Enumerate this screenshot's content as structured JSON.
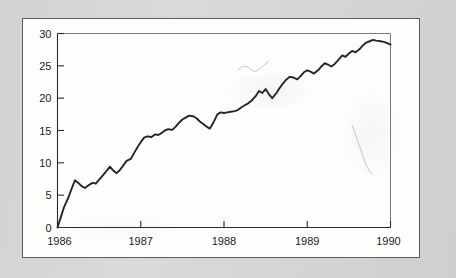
{
  "figure": {
    "panel_background": "#fdfdfc",
    "page_background": "#d6d6d4",
    "frame_color": "#5b5b5b"
  },
  "chart_data": {
    "type": "line",
    "title": "",
    "subtitle": "",
    "xlabel": "",
    "ylabel": "",
    "xlim": [
      1986,
      1990
    ],
    "ylim": [
      0,
      30
    ],
    "grid": false,
    "legend": null,
    "line_color": "#262626",
    "x_tick_labels": [
      "1986",
      "1987",
      "1988",
      "1989",
      "1990"
    ],
    "x_ticks": [
      1986,
      1987,
      1988,
      1989,
      1990
    ],
    "y_tick_labels": [
      "0",
      "5",
      "10",
      "15",
      "20",
      "25",
      "30"
    ],
    "y_ticks": [
      0,
      5,
      10,
      15,
      20,
      25,
      30
    ],
    "series": [
      {
        "name": "series-1",
        "x": [
          1986.0,
          1986.04,
          1986.08,
          1986.13,
          1986.17,
          1986.21,
          1986.25,
          1986.29,
          1986.33,
          1986.38,
          1986.42,
          1986.46,
          1986.5,
          1986.54,
          1986.58,
          1986.63,
          1986.67,
          1986.71,
          1986.75,
          1986.79,
          1986.83,
          1986.88,
          1986.92,
          1986.96,
          1987.0,
          1987.04,
          1987.08,
          1987.13,
          1987.17,
          1987.21,
          1987.25,
          1987.29,
          1987.33,
          1987.38,
          1987.42,
          1987.46,
          1987.5,
          1987.54,
          1987.58,
          1987.63,
          1987.67,
          1987.71,
          1987.75,
          1987.79,
          1987.83,
          1987.88,
          1987.92,
          1987.96,
          1988.0,
          1988.04,
          1988.08,
          1988.13,
          1988.17,
          1988.21,
          1988.25,
          1988.29,
          1988.33,
          1988.38,
          1988.42,
          1988.46,
          1988.5,
          1988.54,
          1988.58,
          1988.63,
          1988.67,
          1988.71,
          1988.75,
          1988.79,
          1988.83,
          1988.88,
          1988.92,
          1988.96,
          1989.0,
          1989.04,
          1989.08,
          1989.13,
          1989.17,
          1989.21,
          1989.25,
          1989.29,
          1989.33,
          1989.38,
          1989.42,
          1989.46,
          1989.5,
          1989.54,
          1989.58,
          1989.63,
          1989.67,
          1989.71,
          1989.75,
          1989.79,
          1989.83,
          1989.88,
          1989.92,
          1989.96,
          1990.0
        ],
        "values": [
          0.0,
          1.6,
          3.2,
          4.6,
          6.0,
          7.3,
          6.9,
          6.4,
          6.1,
          6.6,
          6.9,
          6.8,
          7.4,
          8.0,
          8.6,
          9.4,
          8.8,
          8.4,
          8.9,
          9.6,
          10.3,
          10.6,
          11.5,
          12.4,
          13.2,
          13.9,
          14.1,
          14.0,
          14.4,
          14.3,
          14.6,
          15.0,
          15.2,
          15.1,
          15.6,
          16.2,
          16.7,
          17.0,
          17.3,
          17.2,
          16.9,
          16.4,
          16.0,
          15.6,
          15.3,
          16.4,
          17.5,
          17.8,
          17.7,
          17.8,
          17.9,
          18.0,
          18.2,
          18.6,
          18.9,
          19.2,
          19.6,
          20.3,
          21.1,
          20.8,
          21.4,
          20.6,
          20.0,
          20.8,
          21.6,
          22.3,
          22.9,
          23.3,
          23.2,
          22.9,
          23.4,
          24.0,
          24.3,
          24.1,
          23.8,
          24.3,
          24.9,
          25.4,
          25.2,
          24.9,
          25.3,
          26.0,
          26.6,
          26.4,
          26.9,
          27.3,
          27.1,
          27.6,
          28.2,
          28.6,
          28.8,
          29.0,
          28.9,
          28.8,
          28.7,
          28.5,
          28.3
        ]
      }
    ]
  }
}
